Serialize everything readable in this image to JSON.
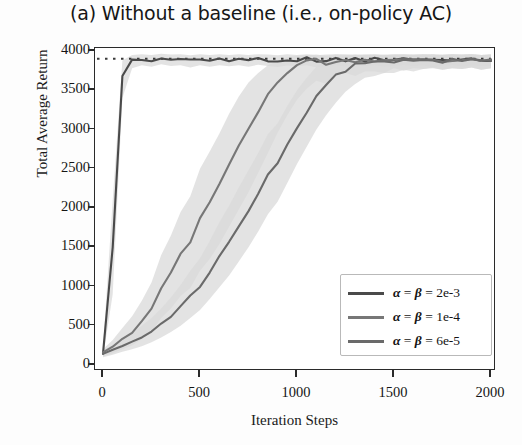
{
  "title": "(a) Without a baseline (i.e., on-policy AC)",
  "axes": {
    "xlabel": "Iteration Steps",
    "ylabel": "Total Average Return",
    "xticks": [
      "0",
      "500",
      "1000",
      "1500",
      "2000"
    ],
    "yticks": [
      "0",
      "500",
      "1000",
      "1500",
      "2000",
      "2500",
      "3000",
      "3500",
      "4000"
    ]
  },
  "legend": {
    "items": [
      {
        "label": "α = β = 2e-3",
        "color": "#4a4a4a"
      },
      {
        "label": "α = β = 1e-4",
        "color": "#777777"
      },
      {
        "label": "α = β = 6e-5",
        "color": "#6a6a6a"
      }
    ]
  },
  "chart_data": {
    "type": "line",
    "title": "(a) Without a baseline (i.e., on-policy AC)",
    "xlabel": "Iteration Steps",
    "ylabel": "Total Average Return",
    "xlim": [
      0,
      2000
    ],
    "ylim": [
      0,
      4000
    ],
    "xticks": [
      0,
      500,
      1000,
      1500,
      2000
    ],
    "yticks": [
      0,
      500,
      1000,
      1500,
      2000,
      2500,
      3000,
      3500,
      4000
    ],
    "grid": false,
    "legend_position": "lower right",
    "reference_line": {
      "style": "dotted",
      "y": 3900,
      "color": "#3a3a3a"
    },
    "bands": "shaded std-dev regions in light gray around each curve",
    "x": [
      0,
      50,
      100,
      150,
      200,
      250,
      300,
      350,
      400,
      450,
      500,
      550,
      600,
      650,
      700,
      750,
      800,
      850,
      900,
      950,
      1000,
      1050,
      1100,
      1150,
      1200,
      1250,
      1300,
      1350,
      1400,
      1450,
      1500,
      1550,
      1600,
      1650,
      1700,
      1750,
      1800,
      1850,
      1900,
      1950,
      2000
    ],
    "series": [
      {
        "name": "α = β = 2e-3",
        "color": "#4a4a4a",
        "values": [
          150,
          1500,
          3680,
          3880,
          3900,
          3880,
          3905,
          3890,
          3900,
          3870,
          3895,
          3880,
          3900,
          3885,
          3895,
          3880,
          3900,
          3890,
          3875,
          3895,
          3885,
          3900,
          3870,
          3890,
          3900,
          3880,
          3895,
          3885,
          3900,
          3875,
          3890,
          3900,
          3885,
          3895,
          3870,
          3890,
          3900,
          3880,
          3895,
          3885,
          3890
        ],
        "band_lo": [
          100,
          900,
          3400,
          3780,
          3820,
          3800,
          3830,
          3810,
          3820,
          3790,
          3820,
          3800,
          3820,
          3805,
          3820,
          3800,
          3825,
          3810,
          3795,
          3815,
          3805,
          3820,
          3790,
          3810,
          3820,
          3800,
          3815,
          3805,
          3820,
          3795,
          3810,
          3820,
          3805,
          3815,
          3790,
          3810,
          3820,
          3800,
          3815,
          3805,
          3810
        ],
        "band_hi": [
          220,
          2100,
          3880,
          3950,
          3960,
          3950,
          3965,
          3955,
          3960,
          3945,
          3960,
          3950,
          3960,
          3950,
          3960,
          3950,
          3960,
          3955,
          3945,
          3960,
          3950,
          3960,
          3945,
          3955,
          3960,
          3950,
          3960,
          3950,
          3960,
          3945,
          3955,
          3960,
          3950,
          3960,
          3945,
          3955,
          3960,
          3950,
          3960,
          3950,
          3955
        ]
      },
      {
        "name": "α = β = 1e-4",
        "color": "#777777",
        "values": [
          150,
          230,
          330,
          420,
          560,
          720,
          980,
          1180,
          1420,
          1560,
          1880,
          2080,
          2300,
          2560,
          2800,
          3020,
          3220,
          3460,
          3600,
          3720,
          3820,
          3860,
          3880,
          3820,
          3880,
          3890,
          3840,
          3890,
          3880,
          3860,
          3895,
          3870,
          3890,
          3880,
          3900,
          3870,
          3890,
          3880,
          3895,
          3870,
          3890
        ],
        "band_lo": [
          110,
          150,
          200,
          250,
          330,
          420,
          600,
          720,
          880,
          980,
          1200,
          1350,
          1540,
          1760,
          1980,
          2200,
          2450,
          2700,
          2960,
          3180,
          3380,
          3520,
          3620,
          3580,
          3680,
          3720,
          3680,
          3740,
          3740,
          3720,
          3780,
          3750,
          3780,
          3770,
          3790,
          3760,
          3780,
          3770,
          3790,
          3760,
          3780
        ],
        "band_hi": [
          200,
          320,
          470,
          620,
          820,
          1050,
          1400,
          1650,
          1950,
          2150,
          2500,
          2720,
          2950,
          3200,
          3420,
          3600,
          3720,
          3820,
          3880,
          3920,
          3940,
          3950,
          3955,
          3940,
          3955,
          3960,
          3945,
          3960,
          3955,
          3950,
          3960,
          3950,
          3960,
          3955,
          3960,
          3950,
          3960,
          3955,
          3960,
          3950,
          3955
        ]
      },
      {
        "name": "α = β = 6e-5",
        "color": "#6a6a6a",
        "values": [
          140,
          190,
          250,
          300,
          360,
          430,
          520,
          620,
          740,
          880,
          1000,
          1180,
          1380,
          1560,
          1760,
          1960,
          2180,
          2420,
          2560,
          2800,
          3020,
          3220,
          3420,
          3560,
          3680,
          3760,
          3820,
          3860,
          3860,
          3880,
          3870,
          3890,
          3860,
          3880,
          3890,
          3870,
          3885,
          3880,
          3890,
          3875,
          3885
        ],
        "band_lo": [
          100,
          130,
          170,
          200,
          240,
          290,
          350,
          420,
          500,
          600,
          700,
          840,
          990,
          1140,
          1320,
          1500,
          1700,
          1920,
          2080,
          2320,
          2560,
          2780,
          3000,
          3180,
          3340,
          3480,
          3580,
          3660,
          3680,
          3720,
          3720,
          3760,
          3740,
          3770,
          3780,
          3760,
          3780,
          3770,
          3790,
          3760,
          3780
        ],
        "band_hi": [
          185,
          255,
          340,
          410,
          500,
          600,
          720,
          860,
          1020,
          1200,
          1360,
          1580,
          1820,
          2030,
          2260,
          2480,
          2700,
          2940,
          3080,
          3300,
          3500,
          3660,
          3800,
          3870,
          3910,
          3930,
          3945,
          3950,
          3950,
          3955,
          3950,
          3960,
          3950,
          3955,
          3960,
          3950,
          3955,
          3955,
          3960,
          3950,
          3955
        ]
      }
    ]
  }
}
